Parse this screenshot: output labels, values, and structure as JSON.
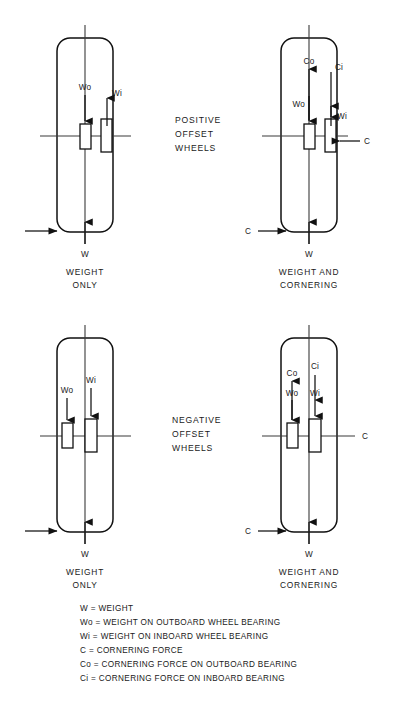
{
  "figure": {
    "title_center_top": [
      "POSITIVE",
      "OFFSET",
      "WHEELS"
    ],
    "title_center_bottom": [
      "NEGATIVE",
      "OFFSET",
      "WHEELS"
    ]
  },
  "panels": [
    {
      "id": "top-left",
      "offset_type": "positive",
      "load_case": "weight-only",
      "caption": [
        "WEIGHT",
        "ONLY"
      ],
      "force_labels": [
        "Wo",
        "Wi",
        "W"
      ]
    },
    {
      "id": "top-right",
      "offset_type": "positive",
      "load_case": "weight-and-cornering",
      "caption": [
        "WEIGHT AND",
        "CORNERING"
      ],
      "force_labels": [
        "Co",
        "Ci",
        "Wo",
        "Wi",
        "C",
        "W"
      ]
    },
    {
      "id": "bottom-left",
      "offset_type": "negative",
      "load_case": "weight-only",
      "caption": [
        "WEIGHT",
        "ONLY"
      ],
      "force_labels": [
        "Wo",
        "Wi",
        "W"
      ]
    },
    {
      "id": "bottom-right",
      "offset_type": "negative",
      "load_case": "weight-and-cornering",
      "caption": [
        "WEIGHT AND",
        "CORNERING"
      ],
      "force_labels": [
        "Co",
        "Ci",
        "Wo",
        "Wi",
        "C",
        "W"
      ]
    }
  ],
  "labels": {
    "Wo": "Wo",
    "Wi": "Wi",
    "W": "W",
    "C": "C",
    "Co": "Co",
    "Ci": "Ci"
  },
  "center_top": {
    "line1": "POSITIVE",
    "line2": "OFFSET",
    "line3": "WHEELS"
  },
  "center_bottom": {
    "line1": "NEGATIVE",
    "line2": "OFFSET",
    "line3": "WHEELS"
  },
  "captions": {
    "weight_only_1": "WEIGHT",
    "weight_only_2": "ONLY",
    "weight_corner_1": "WEIGHT AND",
    "weight_corner_2": "CORNERING"
  },
  "legend": {
    "items": [
      "W = WEIGHT",
      "Wo = WEIGHT ON OUTBOARD WHEEL BEARING",
      "Wi = WEIGHT ON INBOARD WHEEL BEARING",
      "C = CORNERING FORCE",
      "Co = CORNERING FORCE ON OUTBOARD BEARING",
      "Ci = CORNERING FORCE ON INBOARD BEARING"
    ]
  },
  "colors": {
    "ink": "#111111",
    "axis": "#3a3a3a",
    "background": "#ffffff"
  }
}
